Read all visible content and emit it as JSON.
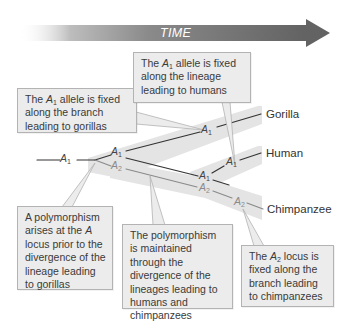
{
  "header": {
    "time_arrow_label": "TIME"
  },
  "taxa": {
    "gorilla": "Gorilla",
    "human": "Human",
    "chimpanzee": "Chimpanzee"
  },
  "allele_labels": {
    "root": {
      "letter": "A",
      "sub": "1"
    },
    "fork_upper": {
      "letter": "A",
      "sub": "1"
    },
    "fork_lower": {
      "letter": "A",
      "sub": "2"
    },
    "gorilla_branch": {
      "letter": "A",
      "sub": "1"
    },
    "hc_upper": {
      "letter": "A",
      "sub": "1"
    },
    "hc_lower": {
      "letter": "A",
      "sub": "2"
    },
    "human_branch": {
      "letter": "A",
      "sub": "1"
    },
    "chimp_branch": {
      "letter": "A",
      "sub": "2"
    }
  },
  "callouts": {
    "gorilla_fixed": {
      "pre": "The ",
      "allele": "A",
      "sub": "1",
      "post": " allele is fixed along the branch leading to gorillas"
    },
    "human_fixed": {
      "pre": "The ",
      "allele": "A",
      "sub": "1",
      "post": " allele is fixed along the lineage leading to humans"
    },
    "polymorphism_arises": {
      "pre": "A polymorphism arises at the ",
      "locus": "A",
      "post": " locus prior to the divergence of the lineage leading to gorillas"
    },
    "polymorphism_maintained": {
      "text": "The polymorphism is maintained through the divergence of the lineages leading to humans and chimpanzees"
    },
    "chimp_fixed": {
      "pre": "The ",
      "allele": "A",
      "sub": "2",
      "post": " locus is fixed along the branch leading to chimpanzees"
    }
  },
  "colors": {
    "arrow_dark": "#6b6b6b",
    "band_gray": "#e3e3e3",
    "callout_bg": "#ececec",
    "callout_border": "#b3b3b3",
    "a1_line": "#333333",
    "a2_line": "#8a8a8a"
  }
}
